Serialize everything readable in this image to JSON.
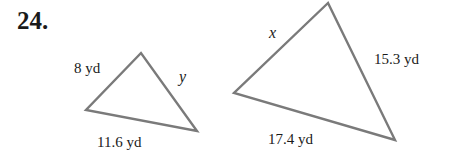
{
  "problem": {
    "number": "24."
  },
  "triangles": [
    {
      "id": "small",
      "vertices": {
        "top": [
          141,
          53
        ],
        "left": [
          86,
          110
        ],
        "right": [
          197,
          131
        ]
      },
      "labels": {
        "left_side": "8 yd",
        "right_side": "y",
        "bottom_side": "11.6 yd"
      }
    },
    {
      "id": "large",
      "vertices": {
        "top": [
          328,
          3
        ],
        "left": [
          234,
          93
        ],
        "right": [
          395,
          140
        ]
      },
      "labels": {
        "left_side": "x",
        "right_side": "15.3 yd",
        "bottom_side": "17.4 yd"
      }
    }
  ],
  "style": {
    "stroke_color": "#7a7a7a",
    "text_color": "#1a1a1a"
  }
}
